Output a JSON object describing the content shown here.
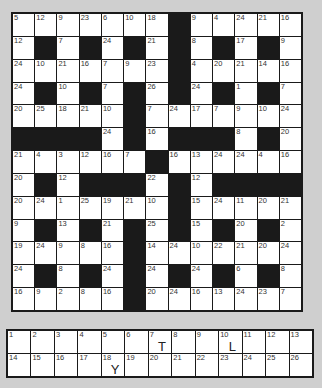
{
  "puzzle": {
    "type": "codeword",
    "rows": 13,
    "cols": 13,
    "grid": [
      [
        5,
        12,
        9,
        23,
        6,
        10,
        18,
        null,
        9,
        4,
        24,
        21,
        16
      ],
      [
        12,
        null,
        7,
        null,
        24,
        null,
        21,
        null,
        8,
        null,
        17,
        null,
        9
      ],
      [
        24,
        10,
        21,
        16,
        7,
        9,
        23,
        null,
        4,
        20,
        21,
        14,
        16
      ],
      [
        24,
        null,
        10,
        null,
        7,
        null,
        26,
        null,
        24,
        null,
        1,
        null,
        7
      ],
      [
        20,
        25,
        18,
        21,
        10,
        null,
        7,
        24,
        17,
        7,
        9,
        10,
        24
      ],
      [
        null,
        null,
        null,
        null,
        24,
        null,
        16,
        null,
        null,
        null,
        8,
        null,
        20
      ],
      [
        21,
        4,
        3,
        12,
        16,
        7,
        null,
        16,
        13,
        24,
        24,
        4,
        16
      ],
      [
        20,
        null,
        12,
        null,
        null,
        null,
        22,
        null,
        12,
        null,
        null,
        null,
        null
      ],
      [
        20,
        24,
        1,
        25,
        19,
        21,
        10,
        null,
        15,
        24,
        11,
        20,
        21
      ],
      [
        9,
        null,
        13,
        null,
        21,
        null,
        25,
        null,
        15,
        null,
        20,
        null,
        2
      ],
      [
        19,
        24,
        9,
        8,
        16,
        null,
        14,
        24,
        10,
        22,
        21,
        20,
        24
      ],
      [
        24,
        null,
        8,
        null,
        24,
        null,
        24,
        null,
        24,
        null,
        6,
        null,
        8
      ],
      [
        16,
        9,
        2,
        8,
        16,
        null,
        20,
        24,
        16,
        13,
        24,
        23,
        7
      ]
    ]
  },
  "key": {
    "cells": [
      {
        "n": "1",
        "letter": ""
      },
      {
        "n": "2",
        "letter": ""
      },
      {
        "n": "3",
        "letter": ""
      },
      {
        "n": "4",
        "letter": ""
      },
      {
        "n": "5",
        "letter": ""
      },
      {
        "n": "6",
        "letter": ""
      },
      {
        "n": "7",
        "letter": "T"
      },
      {
        "n": "8",
        "letter": ""
      },
      {
        "n": "9",
        "letter": ""
      },
      {
        "n": "10",
        "letter": "L"
      },
      {
        "n": "11",
        "letter": ""
      },
      {
        "n": "12",
        "letter": ""
      },
      {
        "n": "13",
        "letter": ""
      },
      {
        "n": "14",
        "letter": ""
      },
      {
        "n": "15",
        "letter": ""
      },
      {
        "n": "16",
        "letter": ""
      },
      {
        "n": "17",
        "letter": ""
      },
      {
        "n": "18",
        "letter": "Y"
      },
      {
        "n": "19",
        "letter": ""
      },
      {
        "n": "20",
        "letter": ""
      },
      {
        "n": "21",
        "letter": ""
      },
      {
        "n": "22",
        "letter": ""
      },
      {
        "n": "23",
        "letter": ""
      },
      {
        "n": "24",
        "letter": ""
      },
      {
        "n": "25",
        "letter": ""
      },
      {
        "n": "26",
        "letter": ""
      }
    ]
  },
  "colors": {
    "background": "#cfcfcf",
    "block": "#1a1a1a",
    "cell": "#ffffff"
  }
}
